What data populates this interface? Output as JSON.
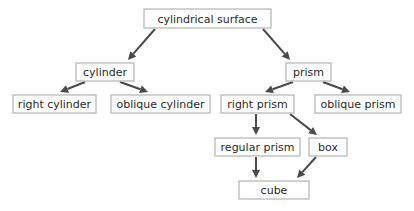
{
  "diagram": {
    "type": "hierarchy",
    "nodes": [
      {
        "id": "cylindrical_surface",
        "label": "cylindrical surface"
      },
      {
        "id": "cylinder",
        "label": "cylinder"
      },
      {
        "id": "prism",
        "label": "prism"
      },
      {
        "id": "right_cylinder",
        "label": "right cylinder"
      },
      {
        "id": "oblique_cylinder",
        "label": "oblique cylinder"
      },
      {
        "id": "right_prism",
        "label": "right prism"
      },
      {
        "id": "oblique_prism",
        "label": "oblique prism"
      },
      {
        "id": "regular_prism",
        "label": "regular prism"
      },
      {
        "id": "box",
        "label": "box"
      },
      {
        "id": "cube",
        "label": "cube"
      }
    ],
    "edges": [
      {
        "from": "cylindrical_surface",
        "to": "cylinder"
      },
      {
        "from": "cylindrical_surface",
        "to": "prism"
      },
      {
        "from": "cylinder",
        "to": "right_cylinder"
      },
      {
        "from": "cylinder",
        "to": "oblique_cylinder"
      },
      {
        "from": "prism",
        "to": "right_prism"
      },
      {
        "from": "prism",
        "to": "oblique_prism"
      },
      {
        "from": "right_prism",
        "to": "regular_prism"
      },
      {
        "from": "right_prism",
        "to": "box"
      },
      {
        "from": "regular_prism",
        "to": "cube"
      },
      {
        "from": "box",
        "to": "cube"
      }
    ],
    "colors": {
      "arrow": "#4a4a4a",
      "border": "#b9b9b9",
      "text": "#2a2a2a"
    }
  }
}
